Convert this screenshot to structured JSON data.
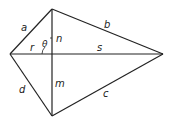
{
  "diagram": {
    "type": "kite / quadrilateral with diagonals",
    "vertices": {
      "left": [
        10,
        54
      ],
      "top": [
        52,
        9
      ],
      "right": [
        163,
        54
      ],
      "bottom": [
        52,
        116
      ],
      "intersection": [
        52,
        54
      ]
    },
    "labels": {
      "a": "a",
      "b": "b",
      "c": "c",
      "d": "d",
      "r": "r",
      "s": "s",
      "n": "n",
      "m": "m",
      "theta": "θ"
    },
    "colors": {
      "line": "#222222",
      "background": "#ffffff"
    }
  }
}
